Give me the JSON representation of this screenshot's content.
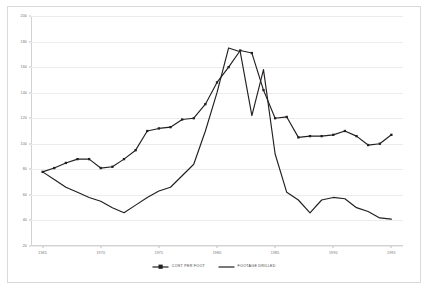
{
  "chart_data": {
    "type": "line",
    "title": "",
    "subtitle": "",
    "xlabel": "",
    "ylabel": "",
    "x": [
      1965,
      1966,
      1967,
      1968,
      1969,
      1970,
      1971,
      1972,
      1973,
      1974,
      1975,
      1976,
      1977,
      1978,
      1979,
      1980,
      1981,
      1982,
      1983,
      1984,
      1985,
      1986,
      1987,
      1988,
      1989,
      1990,
      1991,
      1992,
      1993,
      1994,
      1995
    ],
    "xlim": [
      1964,
      1996
    ],
    "ylim": [
      20,
      200
    ],
    "yticks": [
      20,
      40,
      60,
      80,
      100,
      120,
      140,
      160,
      180,
      200
    ],
    "xticks": [
      1965,
      1970,
      1975,
      1980,
      1985,
      1990,
      1995
    ],
    "xtick_labels": [
      "1965",
      "1970",
      "1975",
      "1980",
      "1985",
      "1990",
      "1995"
    ],
    "ytick_labels": [
      "20",
      "40",
      "60",
      "80",
      "100",
      "120",
      "140",
      "160",
      "180",
      "200"
    ],
    "grid": "horizontal",
    "legend_position": "bottom-center",
    "series": [
      {
        "name": "COST PER FOOT",
        "color": "#231f20",
        "marker": "square",
        "values": [
          78,
          81,
          85,
          88,
          88,
          81,
          82,
          88,
          95,
          110,
          112,
          113,
          119,
          120,
          131,
          148,
          160,
          173,
          171,
          142,
          120,
          121,
          105,
          106,
          106,
          107,
          110,
          106,
          99,
          100,
          107
        ]
      },
      {
        "name": "FOOTAGE DRILLED",
        "color": "#231f20",
        "marker": "none",
        "values": [
          78,
          72,
          66,
          62,
          58,
          55,
          50,
          46,
          52,
          58,
          63,
          66,
          75,
          84,
          110,
          140,
          175,
          172,
          122,
          158,
          92,
          62,
          56,
          46,
          56,
          58,
          57,
          50,
          47,
          42,
          41
        ]
      }
    ]
  },
  "legend": {
    "items": [
      {
        "label": "COST PER FOOT",
        "style": "line-marker"
      },
      {
        "label": "FOOTAGE DRILLED",
        "style": "line"
      }
    ]
  },
  "colors": {
    "series": "#231f20",
    "grid": "#ececec",
    "axis": "#d2d2d2",
    "frame": "#d9d9d9",
    "tick_text": "#6d6e71",
    "background": "#ffffff"
  }
}
